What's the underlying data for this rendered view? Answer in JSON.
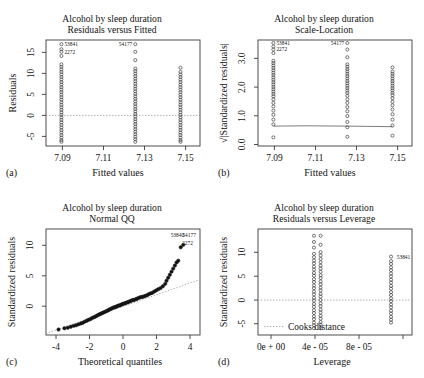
{
  "figure": {
    "caption_letters": [
      "(a)",
      "(b)",
      "(c)",
      "(d)"
    ],
    "shared_title": "Alcohol by sleep duration"
  },
  "chart_data": [
    {
      "panel": "a",
      "letter": "(a)",
      "type": "scatter",
      "title": "Alcohol by sleep duration",
      "subtitle": "Residuals versus Fitted",
      "xlabel": "Fitted values",
      "ylabel": "Residuals",
      "xticks": [
        "7.09",
        "7.11",
        "7.13",
        "7.15"
      ],
      "xtick_values": [
        7.09,
        7.11,
        7.13,
        7.15
      ],
      "yticks": [
        "-5",
        "0",
        "5",
        "10",
        "15"
      ],
      "ytick_values": [
        -5,
        0,
        5,
        10,
        15
      ],
      "xlim": [
        7.082,
        7.157
      ],
      "ylim": [
        -7.2,
        18.0
      ],
      "grid": false,
      "hline_at": 0,
      "annotations": [
        {
          "label": "53841",
          "x": 7.0895,
          "y": 17.0
        },
        {
          "label": "2272",
          "x": 7.0895,
          "y": 15.2
        },
        {
          "label": "54177",
          "x": 7.1255,
          "y": 17.0
        }
      ],
      "series": [
        {
          "name": "column-7.089",
          "x": 7.0895,
          "values": [
            17.0,
            15.8,
            15.2,
            14.2,
            12.2,
            11.6,
            11.0,
            10.4,
            9.8,
            9.2,
            8.6,
            8.0,
            7.4,
            6.8,
            6.2,
            5.6,
            5.0,
            4.4,
            3.8,
            3.2,
            2.6,
            2.0,
            1.4,
            0.8,
            0.2,
            -0.4,
            -1.0,
            -1.6,
            -2.2,
            -2.8,
            -3.4,
            -4.0,
            -4.6,
            -5.2,
            -5.8,
            -6.2
          ]
        },
        {
          "name": "column-7.1255",
          "x": 7.1255,
          "values": [
            17.0,
            15.2,
            13.2,
            11.2,
            10.6,
            10.0,
            9.4,
            8.8,
            8.2,
            7.6,
            7.0,
            6.4,
            5.8,
            5.2,
            4.6,
            4.0,
            3.4,
            2.8,
            2.2,
            1.6,
            1.0,
            0.4,
            -0.2,
            -0.8,
            -1.4,
            -2.0,
            -2.6,
            -3.2,
            -3.8,
            -4.4,
            -5.0,
            -5.6,
            -6.2
          ]
        },
        {
          "name": "column-7.1475",
          "x": 7.1475,
          "values": [
            11.4,
            10.4,
            9.8,
            9.2,
            8.6,
            8.0,
            7.4,
            6.8,
            6.2,
            5.6,
            5.0,
            4.4,
            3.8,
            3.2,
            2.6,
            2.0,
            1.4,
            0.8,
            0.2,
            -0.4,
            -1.0,
            -1.6,
            -2.2,
            -2.8,
            -3.4,
            -4.0,
            -4.6,
            -5.2,
            -5.8,
            -6.2
          ]
        }
      ]
    },
    {
      "panel": "b",
      "letter": "(b)",
      "type": "scatter",
      "title": "Alcohol by sleep duration",
      "subtitle": "Scale-Location",
      "xlabel": "Fitted values",
      "ylabel": "√|Standardized residuals|",
      "xticks": [
        "7.09",
        "7.11",
        "7.13",
        "7.15"
      ],
      "xtick_values": [
        7.09,
        7.11,
        7.13,
        7.15
      ],
      "yticks": [
        "0.0",
        "1.0",
        "2.0",
        "3.0"
      ],
      "ytick_values": [
        0.0,
        1.0,
        2.0,
        3.0
      ],
      "xlim": [
        7.082,
        7.157
      ],
      "ylim": [
        0.05,
        3.62
      ],
      "grid": false,
      "smoother": true,
      "annotations": [
        {
          "label": "53841",
          "x": 7.0895,
          "y": 3.52
        },
        {
          "label": "2272",
          "x": 7.0895,
          "y": 3.3
        },
        {
          "label": "54177",
          "x": 7.1255,
          "y": 3.52
        }
      ],
      "series": [
        {
          "name": "column-7.089",
          "x": 7.0895,
          "values": [
            3.52,
            3.4,
            3.3,
            3.18,
            2.92,
            2.84,
            2.76,
            2.68,
            2.6,
            2.52,
            2.44,
            2.36,
            2.28,
            2.2,
            2.12,
            2.04,
            1.96,
            1.88,
            1.8,
            1.72,
            1.62,
            1.5,
            1.38,
            1.24,
            1.1,
            0.94,
            0.78,
            0.34
          ]
        },
        {
          "name": "column-7.1255",
          "x": 7.1255,
          "values": [
            3.52,
            3.3,
            3.04,
            2.8,
            2.72,
            2.64,
            2.56,
            2.48,
            2.4,
            2.32,
            2.24,
            2.16,
            2.08,
            2.0,
            1.92,
            1.84,
            1.74,
            1.62,
            1.5,
            1.36,
            1.22,
            1.06,
            0.86,
            0.68,
            0.36
          ]
        },
        {
          "name": "column-7.1475",
          "x": 7.1475,
          "values": [
            2.7,
            2.56,
            2.48,
            2.4,
            2.32,
            2.24,
            2.16,
            2.08,
            2.0,
            1.92,
            1.84,
            1.76,
            1.66,
            1.54,
            1.42,
            1.28,
            1.12,
            0.94,
            0.74,
            0.4
          ]
        }
      ],
      "smooth_line": {
        "x": [
          7.0895,
          7.105,
          7.1255,
          7.1475
        ],
        "y": [
          0.72,
          0.73,
          0.72,
          0.7
        ]
      }
    },
    {
      "panel": "c",
      "letter": "(c)",
      "type": "scatter",
      "title": "Alcohol by sleep duration",
      "subtitle": "Normal QQ",
      "xlabel": "Theoretical quantiles",
      "ylabel": "Standardized residuals",
      "xticks": [
        "-4",
        "-2",
        "0",
        "2",
        "4"
      ],
      "xtick_values": [
        -4,
        -2,
        0,
        2,
        4
      ],
      "yticks": [
        "0",
        "5",
        "10"
      ],
      "ytick_values": [
        0,
        5,
        10
      ],
      "xlim": [
        -4.6,
        4.6
      ],
      "ylim": [
        -4.8,
        12.6
      ],
      "grid": false,
      "qq_reference_line": true,
      "annotations": [
        {
          "label": "53840",
          "x": 3.25,
          "y": 11.3
        },
        {
          "label": "54177",
          "x": 3.95,
          "y": 11.3
        },
        {
          "label": "2272",
          "x": 3.85,
          "y": 10.0
        }
      ],
      "points_x": [
        -3.85,
        -3.5,
        -3.3,
        -3.12,
        -2.95,
        -2.8,
        -2.66,
        -2.52,
        -2.4,
        -2.28,
        -2.16,
        -2.05,
        -1.95,
        -1.85,
        -1.75,
        -1.66,
        -1.57,
        -1.48,
        -1.4,
        -1.32,
        -1.24,
        -1.16,
        -1.08,
        -1.0,
        -0.93,
        -0.86,
        -0.79,
        -0.72,
        -0.65,
        -0.58,
        -0.51,
        -0.44,
        -0.37,
        -0.3,
        -0.23,
        -0.16,
        -0.09,
        -0.02,
        0.05,
        0.12,
        0.19,
        0.26,
        0.33,
        0.4,
        0.47,
        0.55,
        0.63,
        0.71,
        0.79,
        0.87,
        0.95,
        1.04,
        1.13,
        1.22,
        1.31,
        1.41,
        1.51,
        1.62,
        1.73,
        1.85,
        1.97,
        2.1,
        2.24,
        2.38,
        2.52,
        2.6,
        2.7,
        2.8,
        2.9,
        3.0,
        3.1,
        3.2,
        3.3,
        3.45,
        3.6
      ],
      "points_y": [
        -3.9,
        -3.7,
        -3.6,
        -3.45,
        -3.3,
        -3.2,
        -3.05,
        -2.9,
        -2.8,
        -2.6,
        -2.45,
        -2.3,
        -2.2,
        -2.0,
        -1.9,
        -1.8,
        -1.65,
        -1.5,
        -1.4,
        -1.3,
        -1.2,
        -1.1,
        -1.0,
        -0.9,
        -0.8,
        -0.7,
        -0.6,
        -0.5,
        -0.4,
        -0.3,
        -0.25,
        -0.2,
        -0.1,
        0.0,
        0.05,
        0.1,
        0.2,
        0.3,
        0.35,
        0.4,
        0.5,
        0.55,
        0.65,
        0.7,
        0.8,
        0.9,
        0.95,
        1.0,
        1.1,
        1.2,
        1.3,
        1.4,
        1.45,
        1.5,
        1.6,
        1.7,
        1.85,
        2.0,
        2.1,
        2.3,
        2.5,
        2.7,
        2.9,
        3.2,
        3.6,
        4.1,
        4.6,
        5.1,
        5.6,
        6.1,
        6.6,
        7.1,
        7.4,
        9.6,
        10.0
      ]
    },
    {
      "panel": "d",
      "letter": "(d)",
      "type": "scatter",
      "title": "Alcohol by sleep duration",
      "subtitle": "Residuals versus Leverage",
      "xlabel": "Leverage",
      "ylabel": "Standardized residuals",
      "xticks": [
        "0e + 00",
        "4e - 05",
        "8e - 05"
      ],
      "xtick_values": [
        0.0,
        4e-05,
        8e-05
      ],
      "yticks": [
        "-5",
        "0",
        "5",
        "10"
      ],
      "ytick_values": [
        -5,
        0,
        5,
        10
      ],
      "xlim": [
        -1.25e-05,
        0.000127
      ],
      "ylim": [
        -6.2,
        12.6
      ],
      "grid": false,
      "legend": "Cooks distance",
      "legend_position": "bottom-left",
      "hline_at": 0,
      "annotations": [
        {
          "label": "53841",
          "x": 0.0001105,
          "y": 7.7
        }
      ],
      "series": [
        {
          "name": "column-3.8e-05",
          "x": 3.82e-05,
          "values": [
            11.4,
            10.3,
            9.3,
            8.2,
            7.6,
            7.0,
            6.5,
            5.9,
            5.4,
            4.8,
            4.3,
            3.7,
            3.2,
            2.6,
            2.1,
            1.5,
            1.0,
            0.4,
            -0.1,
            -0.7,
            -1.2,
            -1.8,
            -2.3,
            -2.9,
            -3.4,
            -4.0,
            -4.5,
            -5.0
          ]
        },
        {
          "name": "column-4.4e-05",
          "x": 4.42e-05,
          "values": [
            11.4,
            9.8,
            8.5,
            7.9,
            7.3,
            6.7,
            6.1,
            5.6,
            5.0,
            4.4,
            3.9,
            3.3,
            2.8,
            2.2,
            1.7,
            1.1,
            0.6,
            0.0,
            -0.6,
            -1.1,
            -1.7,
            -2.2,
            -2.8,
            -3.3,
            -3.9,
            -4.4,
            -5.0
          ]
        },
        {
          "name": "column-1.08e-04",
          "x": 0.000108,
          "values": [
            7.7,
            6.9,
            6.4,
            5.8,
            5.3,
            4.7,
            4.2,
            3.6,
            3.1,
            2.5,
            2.0,
            1.4,
            0.9,
            0.3,
            -0.2,
            -0.8,
            -1.3,
            -1.9,
            -2.4,
            -3.0,
            -3.5,
            -4.0
          ]
        }
      ]
    }
  ]
}
